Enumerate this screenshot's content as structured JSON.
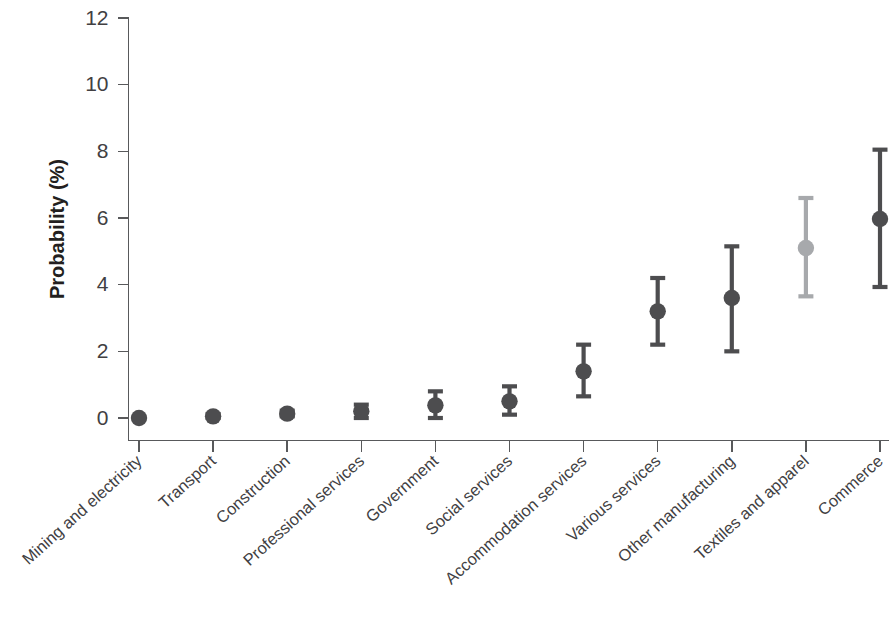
{
  "chart_data": {
    "type": "scatter",
    "title": "",
    "xlabel": "",
    "ylabel": "Probability (%)",
    "ylim": [
      0,
      12
    ],
    "yticks": [
      0,
      2,
      4,
      6,
      8,
      10,
      12
    ],
    "ytick_labels": [
      "0",
      "2",
      "4",
      "6",
      "8",
      "10",
      "12"
    ],
    "grid": false,
    "legend": "none",
    "error_bars": "vertical, capped (95% confidence interval)",
    "categories": [
      "Mining and electricity",
      "Transport",
      "Construction",
      "Professional services",
      "Government",
      "Social services",
      "Accommodation services",
      "Various services",
      "Other manufacturing",
      "Textiles and apparel",
      "Commerce"
    ],
    "values": [
      0.0,
      0.05,
      0.13,
      0.2,
      0.38,
      0.5,
      1.4,
      3.2,
      3.6,
      5.1,
      5.97
    ],
    "err_low": [
      0.0,
      0.0,
      0.05,
      0.0,
      0.0,
      0.1,
      0.65,
      2.2,
      2.0,
      3.65,
      3.93
    ],
    "err_high": [
      0.05,
      0.12,
      0.22,
      0.4,
      0.8,
      0.95,
      2.2,
      4.2,
      5.15,
      6.6,
      8.05
    ],
    "point_colors": [
      "#4d4d4f",
      "#4d4d4f",
      "#4d4d4f",
      "#4d4d4f",
      "#4d4d4f",
      "#4d4d4f",
      "#4d4d4f",
      "#4d4d4f",
      "#4d4d4f",
      "#a7a9ac",
      "#4d4d4f"
    ],
    "colors": {
      "dark_marker": "#4d4d4f",
      "highlight_marker": "#a7a9ac",
      "axis": "#58595b",
      "text": "#414042",
      "background": "#ffffff"
    }
  },
  "axes": {
    "y_title": "Probability (%)"
  }
}
